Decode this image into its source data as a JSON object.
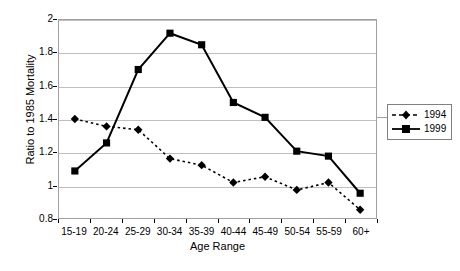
{
  "chart_data": {
    "type": "line",
    "title": "",
    "xlabel": "Age Range",
    "ylabel": "Ratio to 1985 Mortality",
    "categories": [
      "15-19",
      "20-24",
      "25-29",
      "30-34",
      "35-39",
      "40-44",
      "45-49",
      "50-54",
      "55-59",
      "60+"
    ],
    "ylim": [
      0.8,
      2
    ],
    "yticks": [
      "0.8",
      "1",
      "1.2",
      "1.4",
      "1.6",
      "1.8",
      "2"
    ],
    "ytick_values": [
      0.8,
      1.0,
      1.2,
      1.4,
      1.6,
      1.8,
      2.0
    ],
    "grid": "horizontal",
    "legend_position": "right",
    "series": [
      {
        "name": "1994",
        "marker": "diamond",
        "line_style": "dashed",
        "color": "#000000",
        "values": [
          1.4,
          1.355,
          1.335,
          1.16,
          1.12,
          1.015,
          1.05,
          0.97,
          1.015,
          0.85
        ]
      },
      {
        "name": "1999",
        "marker": "square",
        "line_style": "solid",
        "color": "#000000",
        "values": [
          1.085,
          1.255,
          1.7,
          1.92,
          1.85,
          1.5,
          1.41,
          1.205,
          1.175,
          0.95
        ]
      }
    ]
  },
  "legend": {
    "entries": [
      {
        "label": "1994"
      },
      {
        "label": "1999"
      }
    ]
  }
}
